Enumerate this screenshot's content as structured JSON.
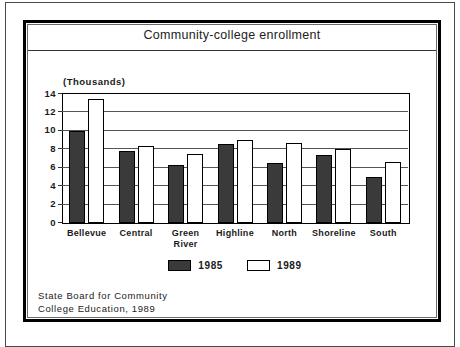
{
  "figure": {
    "title": "Community-college enrollment",
    "source_line1": "State Board for Community",
    "source_line2": "College Education, 1989"
  },
  "colors": {
    "bar_1985": "#3a3a3a",
    "bar_1989": "#ffffff",
    "outline": "#000000",
    "gridline": "#555555",
    "background": "#ffffff"
  },
  "chart_data": {
    "type": "bar",
    "title": "Community-college enrollment",
    "ylabel": "(Thousands)",
    "xlabel": "",
    "categories": [
      "Bellevue",
      "Central",
      "Green River",
      "Highline",
      "North",
      "Shoreline",
      "South"
    ],
    "series": [
      {
        "name": "1985",
        "values": [
          10.0,
          7.8,
          6.3,
          8.6,
          6.5,
          7.4,
          5.0
        ]
      },
      {
        "name": "1989",
        "values": [
          13.5,
          8.4,
          7.5,
          9.0,
          8.7,
          8.0,
          6.6
        ]
      }
    ],
    "ylim": [
      0,
      14
    ],
    "ytick_step": 2,
    "yticks": [
      0,
      2,
      4,
      6,
      8,
      10,
      12,
      14
    ],
    "grid": "horizontal",
    "legend_position": "bottom"
  }
}
